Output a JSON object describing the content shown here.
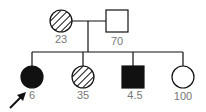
{
  "pedigree": {
    "parents": [
      {
        "id": "mother",
        "shape": "circle",
        "fill": "hatched",
        "label": "23",
        "cx": 61,
        "cy": 21
      },
      {
        "id": "father",
        "shape": "square",
        "fill": "open",
        "label": "70",
        "cx": 117,
        "cy": 21
      }
    ],
    "children": [
      {
        "id": "child-1",
        "shape": "circle",
        "fill": "solid",
        "label": "6",
        "proband": true,
        "cx": 32,
        "cy": 77
      },
      {
        "id": "child-2",
        "shape": "circle",
        "fill": "hatched",
        "label": "35",
        "proband": false,
        "cx": 83,
        "cy": 77
      },
      {
        "id": "child-3",
        "shape": "square",
        "fill": "solid",
        "label": "4.5",
        "proband": false,
        "cx": 133,
        "cy": 77
      },
      {
        "id": "child-4",
        "shape": "circle",
        "fill": "open",
        "label": "100",
        "proband": false,
        "cx": 183,
        "cy": 77
      }
    ],
    "colors": {
      "line": "#111111",
      "label": "#777777"
    }
  }
}
